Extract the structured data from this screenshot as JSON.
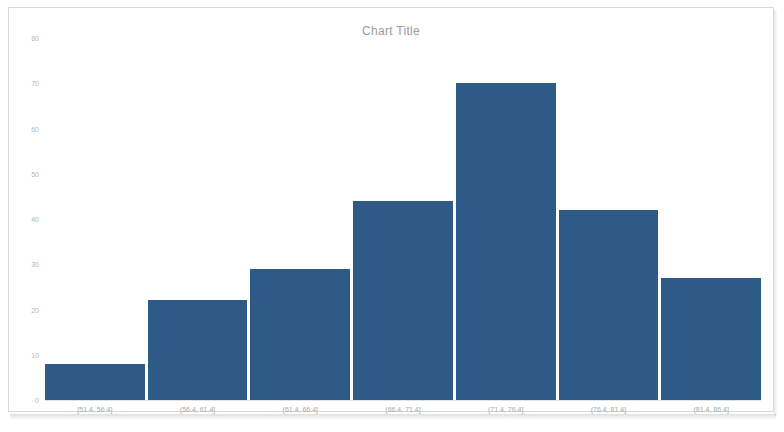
{
  "chart_data": {
    "type": "bar",
    "title": "Chart Title",
    "xlabel": "",
    "ylabel": "",
    "categories": [
      "[51.4, 56.4]",
      "(56.4, 61.4]",
      "(61.4, 66.4]",
      "(66.4, 71.4]",
      "(71.4, 76.4]",
      "(76.4, 81.4]",
      "(81.4, 86.4]"
    ],
    "values": [
      8,
      22,
      29,
      44,
      70,
      42,
      27
    ],
    "ylim": [
      0,
      80
    ],
    "yticks": [
      0,
      10,
      20,
      30,
      40,
      50,
      60,
      70,
      80
    ],
    "ytick_labels": [
      "0",
      "10",
      "20",
      "30",
      "40",
      "50",
      "60",
      "70",
      "80"
    ],
    "grid": false,
    "legend": null,
    "bar_color": "#2e5a87",
    "axis_text_color": "#b4b4b4",
    "title_color": "#9b9b9b",
    "frame_border_color": "#d9d9d9",
    "background_color": "#ffffff"
  }
}
